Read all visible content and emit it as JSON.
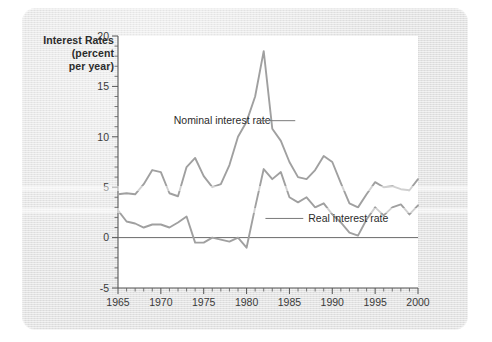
{
  "axis_title": {
    "line1": "Interest Rates",
    "line2": "(percent",
    "line3": "per year)"
  },
  "labels": {
    "nominal": "Nominal interest rate",
    "real": "Real interest rate"
  },
  "chart_data": {
    "type": "line",
    "title": "",
    "xlabel": "",
    "ylabel": "Interest Rates (percent per year)",
    "xlim": [
      1965,
      2000
    ],
    "ylim": [
      -5,
      20
    ],
    "yticks": [
      -5,
      0,
      5,
      10,
      15,
      20
    ],
    "ytick_labels": [
      "-5",
      "0",
      "5",
      "10",
      "15",
      "20"
    ],
    "y_minor_step": 1,
    "xticks": [
      1965,
      1970,
      1975,
      1980,
      1985,
      1990,
      1995,
      2000
    ],
    "xtick_labels": [
      "1965",
      "1970",
      "1975",
      "1980",
      "1985",
      "1990",
      "1995",
      "2000"
    ],
    "x_minor_step": 1,
    "grid": false,
    "legend": "inline-annotations",
    "zero_reference_line": 0,
    "x": [
      1965,
      1966,
      1967,
      1968,
      1969,
      1970,
      1971,
      1972,
      1973,
      1974,
      1975,
      1976,
      1977,
      1978,
      1979,
      1980,
      1981,
      1982,
      1983,
      1984,
      1985,
      1986,
      1987,
      1988,
      1989,
      1990,
      1991,
      1992,
      1993,
      1994,
      1995,
      1996,
      1997,
      1998,
      1999,
      2000
    ],
    "series": [
      {
        "name": "Nominal interest rate",
        "values": [
          4.3,
          4.4,
          4.3,
          5.3,
          6.7,
          6.5,
          4.4,
          4.1,
          7.0,
          7.9,
          6.1,
          5.0,
          5.3,
          7.2,
          10.0,
          11.5,
          14.0,
          18.5,
          10.8,
          9.6,
          7.5,
          6.0,
          5.8,
          6.7,
          8.1,
          7.5,
          5.4,
          3.4,
          3.0,
          4.3,
          5.5,
          5.0,
          5.1,
          4.8,
          4.7,
          5.8
        ]
      },
      {
        "name": "Real interest rate",
        "values": [
          2.7,
          1.6,
          1.4,
          1.0,
          1.3,
          1.3,
          1.0,
          1.5,
          2.1,
          -0.5,
          -0.5,
          0.0,
          -0.2,
          -0.4,
          0.0,
          -1.0,
          3.0,
          6.8,
          5.8,
          6.5,
          4.0,
          3.5,
          4.0,
          3.0,
          3.4,
          2.3,
          1.5,
          0.5,
          0.2,
          1.8,
          3.0,
          2.2,
          3.0,
          3.3,
          2.3,
          3.2
        ]
      }
    ],
    "annotations": [
      {
        "text": "Nominal interest rate",
        "x": 1971.5,
        "y": 11.6,
        "leader_to_x": 1981.3,
        "leader_to_y": 11.6
      },
      {
        "text": "Real interest rate",
        "x": 1987.2,
        "y": 1.9,
        "leader_to_x": 1982.2,
        "leader_to_y": 1.9
      }
    ]
  },
  "colors": {
    "line": "#a0a0a0",
    "axis": "#555555",
    "panel": "#e2e2e2",
    "plot_background": "#ffffff",
    "text": "#2b2b2b"
  }
}
